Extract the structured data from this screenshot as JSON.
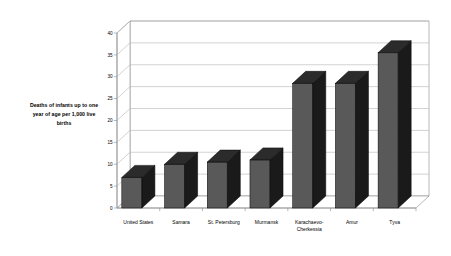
{
  "chart_data": {
    "type": "bar",
    "title": "",
    "subtitle": "",
    "xlabel": "",
    "ylabel": "Deaths of infants up to one year of age per 1,000 live births",
    "categories": [
      "United States",
      "Samara",
      "St. Petersburg",
      "Murmansk",
      "Karachaevo-Cherkessia",
      "Amur",
      "Tyva"
    ],
    "values": [
      7,
      10,
      10.5,
      11,
      28.5,
      28.5,
      35.5
    ],
    "ylim": [
      0,
      40
    ],
    "ytick_labels": [
      "0",
      "5",
      "10",
      "15",
      "20",
      "25",
      "30",
      "35",
      "40"
    ],
    "ytick_values": [
      0,
      5,
      10,
      15,
      20,
      25,
      30,
      35,
      40
    ],
    "grid": true,
    "legend": false,
    "legend_position": "none",
    "style": "3d-column",
    "bar_face_color": "#595959",
    "bar_side_color": "#1a1a1a",
    "bar_top_color": "#2b2b2b",
    "axis_color": "#8a8a8a",
    "grid_color": "#b5b5b5",
    "background_color": "#ffffff",
    "plot_wall_color": "#ffffff"
  },
  "axis_title_lines": [
    "Deaths of infants up to one",
    "year of age per 1,000 live",
    "births"
  ]
}
